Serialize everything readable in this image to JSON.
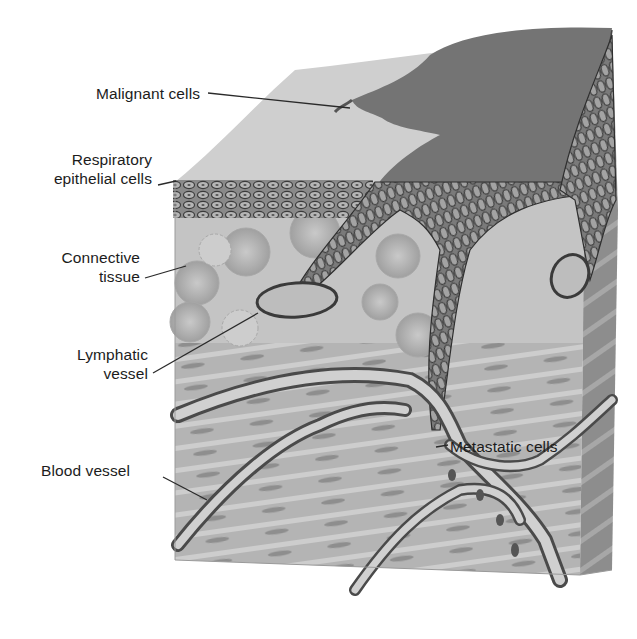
{
  "diagram": {
    "type": "anatomical-cross-section",
    "colors": {
      "background": "#ffffff",
      "surface_light": "#cfcfcf",
      "tumor_dark": "#6e6e6e",
      "front_face": "#b9b9b9",
      "side_face": "#8f8f8f",
      "outline": "#3a3a3a",
      "label_text": "#1c1c1c",
      "leader_line": "#2a2a2a"
    },
    "labels": [
      {
        "id": "malignant-cells",
        "text": "Malignant cells"
      },
      {
        "id": "respiratory-epithelial-cells",
        "lines": [
          "Respiratory",
          "epithelial cells"
        ]
      },
      {
        "id": "connective-tissue",
        "lines": [
          "Connective",
          "tissue"
        ]
      },
      {
        "id": "lymphatic-vessel",
        "lines": [
          "Lymphatic",
          "vessel"
        ]
      },
      {
        "id": "blood-vessel",
        "text": "Blood vessel"
      },
      {
        "id": "metastatic-cells",
        "text": "Metastatic cells"
      }
    ]
  }
}
